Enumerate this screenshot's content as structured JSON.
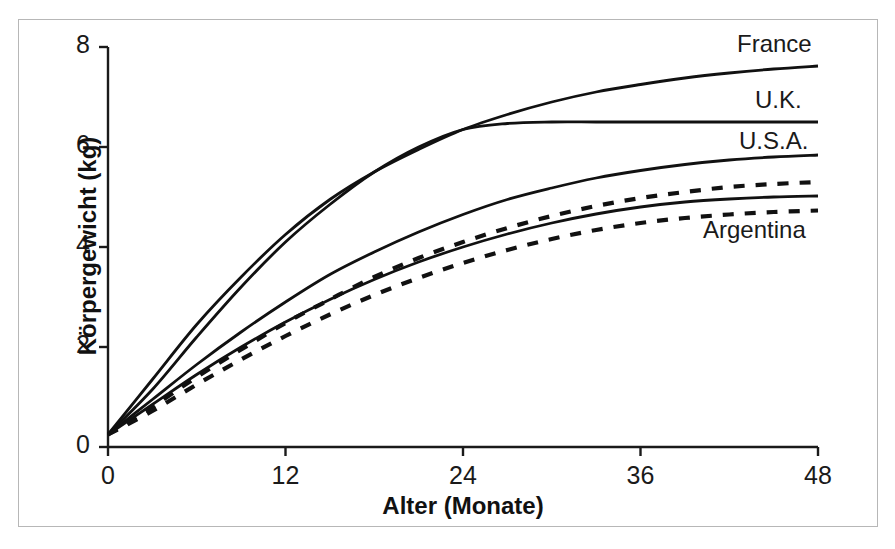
{
  "chart_data": {
    "type": "line",
    "title": "",
    "subtitle": "",
    "xlabel": "Alter (Monate)",
    "ylabel": "Körpergewicht (kg)",
    "xlim": [
      0,
      48
    ],
    "ylim": [
      0,
      8
    ],
    "xticks": [
      "0",
      "12",
      "24",
      "36",
      "48"
    ],
    "xtick_values": [
      0,
      12,
      24,
      36,
      48
    ],
    "yticks": [
      "0",
      "2",
      "4",
      "6",
      "8"
    ],
    "ytick_values": [
      0,
      2,
      4,
      6,
      8
    ],
    "grid": false,
    "legend_position": "inline-right-end-of-curve",
    "x": [
      0,
      3,
      6,
      9,
      12,
      15,
      18,
      21,
      24,
      27,
      30,
      33,
      36,
      39,
      42,
      45,
      48
    ],
    "series": [
      {
        "name": "France",
        "label": "France",
        "style": "solid",
        "color": "#111111",
        "values": [
          0.25,
          1.35,
          2.45,
          3.4,
          4.25,
          4.95,
          5.5,
          5.95,
          6.35,
          6.65,
          6.9,
          7.1,
          7.25,
          7.38,
          7.48,
          7.56,
          7.62
        ]
      },
      {
        "name": "U.K.",
        "label": "U.K.",
        "style": "solid",
        "color": "#111111",
        "values": [
          0.25,
          1.15,
          2.2,
          3.2,
          4.1,
          4.85,
          5.5,
          6.0,
          6.35,
          6.47,
          6.5,
          6.5,
          6.5,
          6.5,
          6.5,
          6.5,
          6.5
        ]
      },
      {
        "name": "U.S.A.",
        "label": "U.S.A.",
        "style": "solid",
        "color": "#111111",
        "values": [
          0.25,
          0.95,
          1.65,
          2.3,
          2.9,
          3.45,
          3.9,
          4.3,
          4.65,
          4.95,
          5.18,
          5.38,
          5.53,
          5.65,
          5.74,
          5.8,
          5.84
        ]
      },
      {
        "name": "dashed-upper",
        "label": "",
        "style": "dashed",
        "color": "#111111",
        "values": [
          0.25,
          0.8,
          1.4,
          1.95,
          2.48,
          2.95,
          3.4,
          3.78,
          4.1,
          4.38,
          4.62,
          4.82,
          4.98,
          5.1,
          5.2,
          5.26,
          5.3
        ]
      },
      {
        "name": "solid-lower",
        "label": "",
        "style": "solid",
        "color": "#111111",
        "values": [
          0.25,
          0.85,
          1.45,
          2.0,
          2.5,
          2.95,
          3.35,
          3.7,
          4.0,
          4.26,
          4.48,
          4.66,
          4.8,
          4.9,
          4.96,
          5.0,
          5.02
        ]
      },
      {
        "name": "Argentina",
        "label": "Argentina",
        "style": "dashed",
        "color": "#111111",
        "values": [
          0.25,
          0.72,
          1.25,
          1.75,
          2.22,
          2.65,
          3.04,
          3.38,
          3.68,
          3.94,
          4.16,
          4.34,
          4.48,
          4.58,
          4.65,
          4.7,
          4.73
        ]
      }
    ],
    "annotations": [
      {
        "text": "France",
        "x_px": 737,
        "y_px": 30
      },
      {
        "text": "U.K.",
        "x_px": 755,
        "y_px": 86
      },
      {
        "text": "U.S.A.",
        "x_px": 739,
        "y_px": 127
      },
      {
        "text": "Argentina",
        "x_px": 703,
        "y_px": 216
      }
    ],
    "colors": {
      "line": "#111111",
      "axis": "#1a1a1a",
      "frame": "#b7b7b7",
      "background": "#ffffff"
    }
  }
}
